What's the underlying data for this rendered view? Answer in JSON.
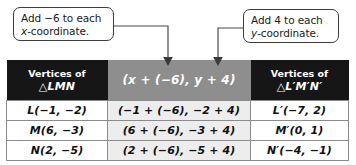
{
  "callouts": {
    "left": {
      "line1_prefix": "Add ",
      "line1_value": "−6",
      "line1_suffix": " to each",
      "line2_var": "x",
      "line2_rest": "-coordinate."
    },
    "right": {
      "line1_prefix": "Add ",
      "line1_value": "4",
      "line1_suffix": " to each",
      "line2_var": "y",
      "line2_rest": "-coordinate."
    }
  },
  "table": {
    "headers": {
      "col1_line1": "Vertices of",
      "col1_line2": "△LMN",
      "col2": "(x + (−6), y + 4)",
      "col3_line1": "Vertices of",
      "col3_line2": "△L′M′N′"
    },
    "rows": [
      {
        "original": "L(−1, −2)",
        "substitution": "(−1 + (−6), −2 + 4)",
        "image": "L′(−7, 2)"
      },
      {
        "original": "M(6, −3)",
        "substitution": "(6 + (−6), −3 + 4)",
        "image": "M′(0, 1)"
      },
      {
        "original": "N(2, −5)",
        "substitution": "(2 + (−6), −5 + 4)",
        "image": "N′(−4, −1)"
      }
    ]
  },
  "colors": {
    "header_dark": "#161616",
    "header_gray": "#8e8e8e",
    "middle_column": "#ededed",
    "border": "#8b8b8b",
    "callout_border": "#3c3c3c",
    "connector": "#4a4a4a"
  }
}
